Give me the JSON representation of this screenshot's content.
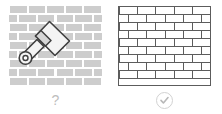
{
  "canvas": {
    "width": 222,
    "height": 114,
    "background": "#ffffff"
  },
  "colors": {
    "brick_fill": "#cdcdcd",
    "wall_outline": "#5c5c5c",
    "caption_gray": "#bdbdbd",
    "check_gray": "#b8b8b8",
    "icon_outline": "#444444",
    "icon_fill": "#f2f2f2",
    "icon_mid": "#d9d9d9"
  },
  "panels": [
    {
      "id": "before",
      "name": "unpainted-brick-wall-panel",
      "style": "filled-gray-bricks",
      "overlay_icon": "trowel-icon",
      "caption": {
        "glyph": "?",
        "icon": "question-mark",
        "label": "?"
      }
    },
    {
      "id": "after",
      "name": "outlined-brick-wall-panel",
      "style": "outlined-bricks",
      "overlay_icon": null,
      "caption": {
        "glyph": "✓",
        "icon": "check-circle-icon",
        "label": "✓"
      }
    }
  ],
  "left_panel": {
    "rows": 9,
    "bricks_per_row": 5,
    "offset_pattern": "running-bond"
  },
  "right_panel": {
    "rows": 9,
    "bricks_per_row": 5,
    "offset_pattern": "running-bond",
    "border": "1px solid #5c5c5c"
  },
  "captions": {
    "left": "?",
    "right": "✓"
  }
}
